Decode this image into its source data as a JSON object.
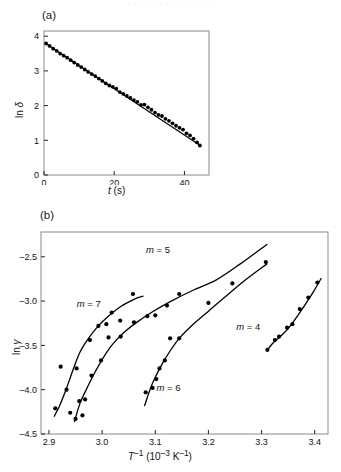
{
  "figure": {
    "top_cut_text": ". . . . . . . . . . . . . .",
    "panel_a_tag": "(a)",
    "panel_b_tag": "(b)"
  },
  "panel_a": {
    "ylabel_pre": "ln ",
    "ylabel_sym": "δ",
    "xlabel_sym": "t",
    "xlabel_unit": " (s)",
    "xticks": [
      "0",
      "20",
      "40"
    ],
    "xtick_values": [
      0,
      20,
      40
    ],
    "yticks": [
      "0",
      "1",
      "2",
      "3",
      "4"
    ],
    "ytick_values": [
      0,
      1,
      2,
      3,
      4
    ],
    "xlim": [
      0,
      47
    ],
    "ylim": [
      0,
      4.15
    ]
  },
  "panel_b": {
    "ylabel_pre": "ln ",
    "ylabel_sym": "γ",
    "xlabel_sym": "T",
    "xlabel_sup": "–1",
    "xlabel_unit_pre": " (10",
    "xlabel_unit_sup": "–3",
    "xlabel_unit_post": " K",
    "xlabel_unit_sup2": "–1",
    "xlabel_unit_end": ")",
    "xticks": [
      "2.9",
      "3.0",
      "3.1",
      "3.2",
      "3.3",
      "3.4"
    ],
    "xtick_values": [
      2.9,
      3.0,
      3.1,
      3.2,
      3.3,
      3.4
    ],
    "yticks": [
      "–2.5",
      "–3.0",
      "–3.5",
      "–4.0",
      "–4.5"
    ],
    "ytick_values": [
      -2.5,
      -3.0,
      -3.5,
      -4.0,
      -4.5
    ],
    "xlim": [
      2.885,
      3.425
    ],
    "ylim": [
      -4.5,
      -2.22
    ],
    "curve_labels": [
      {
        "id": "m7",
        "prefix": "m",
        "eq": " = 7",
        "x": 2.975,
        "y": -3.07
      },
      {
        "id": "m5",
        "prefix": "m",
        "eq": " = 5",
        "x": 3.105,
        "y": -2.46
      },
      {
        "id": "m6",
        "prefix": "m",
        "eq": " = 6",
        "x": 3.125,
        "y": -4.02
      },
      {
        "id": "m4",
        "prefix": "m",
        "eq": " = 4",
        "x": 3.275,
        "y": -3.33
      }
    ]
  },
  "chart_data": [
    {
      "type": "scatter",
      "id": "panel-a",
      "title": "(a)",
      "xlabel": "t (s)",
      "ylabel": "ln δ",
      "xlim": [
        0,
        47
      ],
      "ylim": [
        0,
        4.15
      ],
      "grid": false,
      "legend": "none",
      "fit_line": {
        "x": [
          0.4,
          44.6
        ],
        "y": [
          3.8,
          0.84
        ]
      },
      "x": [
        0.6,
        1.6,
        2.6,
        3.6,
        4.6,
        5.6,
        6.6,
        7.6,
        8.6,
        9.6,
        10.6,
        11.6,
        12.6,
        13.6,
        14.6,
        15.6,
        16.6,
        17.6,
        18.6,
        19.6,
        20.6,
        21.6,
        22.6,
        23.6,
        24.6,
        25.6,
        26.6,
        27.6,
        28.6,
        29.6,
        30.6,
        31.6,
        32.6,
        33.6,
        34.6,
        35.6,
        36.6,
        37.6,
        38.6,
        39.6,
        40.6,
        41.6,
        42.6,
        43.6,
        44.4
      ],
      "y": [
        3.79,
        3.72,
        3.64,
        3.58,
        3.5,
        3.44,
        3.38,
        3.31,
        3.24,
        3.17,
        3.11,
        3.04,
        2.97,
        2.91,
        2.85,
        2.78,
        2.71,
        2.64,
        2.58,
        2.54,
        2.49,
        2.39,
        2.34,
        2.28,
        2.22,
        2.16,
        2.11,
        2.02,
        2.03,
        1.95,
        1.88,
        1.8,
        1.73,
        1.7,
        1.62,
        1.56,
        1.49,
        1.42,
        1.36,
        1.31,
        1.2,
        1.14,
        1.05,
        0.94,
        0.85
      ]
    },
    {
      "type": "scatter",
      "id": "panel-b",
      "title": "(b)",
      "xlabel": "T–1 (10–3 K–1)",
      "ylabel": "ln γ",
      "xlim": [
        2.885,
        3.425
      ],
      "ylim": [
        -4.5,
        -2.22
      ],
      "grid": false,
      "legend": "inline-labels",
      "series": [
        {
          "name": "m = 7",
          "x": [
            2.912,
            2.922,
            2.933,
            2.94,
            2.952,
            2.963,
            2.977,
            2.993,
            3.008,
            3.018,
            3.034,
            3.058
          ],
          "y": [
            -4.21,
            -3.74,
            -4.0,
            -4.26,
            -3.76,
            -4.29,
            -3.44,
            -3.28,
            -3.26,
            -3.13,
            -3.22,
            -2.92
          ],
          "fit_x": [
            2.91,
            3.077
          ],
          "fit_points": [
            [
              2.91,
              -4.3
            ],
            [
              2.92,
              -4.18
            ],
            [
              2.932,
              -4.0
            ],
            [
              2.945,
              -3.78
            ],
            [
              2.958,
              -3.58
            ],
            [
              2.972,
              -3.44
            ],
            [
              2.99,
              -3.3
            ],
            [
              3.01,
              -3.18
            ],
            [
              3.035,
              -3.06
            ],
            [
              3.06,
              -2.98
            ],
            [
              3.077,
              -2.945
            ]
          ]
        },
        {
          "name": "m = 5",
          "x": [
            2.95,
            2.957,
            2.968,
            2.98,
            2.998,
            3.012,
            3.035,
            3.06,
            3.085,
            3.1,
            3.122,
            3.145
          ],
          "y": [
            -4.33,
            -4.13,
            -4.11,
            -3.84,
            -3.67,
            -3.41,
            -3.4,
            -3.24,
            -3.17,
            -3.16,
            -3.05,
            -2.92
          ],
          "fit_x": [
            2.948,
            3.31
          ],
          "fit_points": [
            [
              2.948,
              -4.36
            ],
            [
              2.958,
              -4.16
            ],
            [
              2.97,
              -4.0
            ],
            [
              2.985,
              -3.82
            ],
            [
              3.0,
              -3.66
            ],
            [
              3.018,
              -3.5
            ],
            [
              3.04,
              -3.36
            ],
            [
              3.065,
              -3.24
            ],
            [
              3.095,
              -3.12
            ],
            [
              3.13,
              -3.0
            ],
            [
              3.17,
              -2.88
            ],
            [
              3.215,
              -2.76
            ],
            [
              3.26,
              -2.58
            ],
            [
              3.31,
              -2.36
            ]
          ]
        },
        {
          "name": "m = 6",
          "x": [
            3.082,
            3.095,
            3.102,
            3.108,
            3.118,
            3.128,
            3.145,
            3.2,
            3.245,
            3.308
          ],
          "y": [
            -4.03,
            -3.98,
            -3.88,
            -3.76,
            -3.67,
            -3.42,
            -3.42,
            -3.02,
            -2.8,
            -2.56
          ],
          "fit_x": [
            3.08,
            3.31
          ],
          "fit_points": [
            [
              3.08,
              -4.18
            ],
            [
              3.09,
              -4.0
            ],
            [
              3.1,
              -3.86
            ],
            [
              3.112,
              -3.72
            ],
            [
              3.126,
              -3.58
            ],
            [
              3.145,
              -3.42
            ],
            [
              3.168,
              -3.28
            ],
            [
              3.195,
              -3.14
            ],
            [
              3.23,
              -2.96
            ],
            [
              3.27,
              -2.76
            ],
            [
              3.31,
              -2.58
            ]
          ]
        },
        {
          "name": "m = 4",
          "x": [
            3.311,
            3.325,
            3.333,
            3.348,
            3.358,
            3.372,
            3.388,
            3.405
          ],
          "y": [
            -3.55,
            -3.44,
            -3.4,
            -3.3,
            -3.26,
            -3.09,
            -2.96,
            -2.79
          ],
          "fit_x": [
            3.31,
            3.412
          ],
          "fit_points": [
            [
              3.31,
              -3.56
            ],
            [
              3.322,
              -3.47
            ],
            [
              3.335,
              -3.4
            ],
            [
              3.35,
              -3.31
            ],
            [
              3.365,
              -3.19
            ],
            [
              3.382,
              -3.04
            ],
            [
              3.398,
              -2.89
            ],
            [
              3.412,
              -2.745
            ]
          ]
        }
      ]
    }
  ]
}
